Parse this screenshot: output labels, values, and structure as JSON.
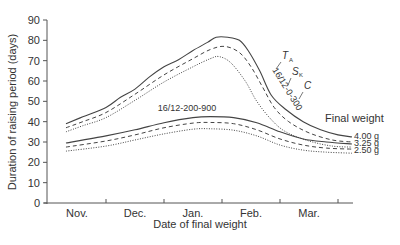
{
  "chart_data": {
    "type": "line",
    "title": "",
    "xlabel": "Date of final weight",
    "ylabel": "Duration of raising period (days)",
    "ylim": [
      0,
      90
    ],
    "yticks": [
      0,
      10,
      20,
      30,
      40,
      50,
      60,
      70,
      80,
      90
    ],
    "x_categories": [
      "Nov.",
      "Dec.",
      "Jan.",
      "Feb.",
      "Mar."
    ],
    "x_note": "x values expressed as month index (0=Nov tick, 1=Dec, 2=Jan, 3=Feb, 4=Mar)",
    "grid": false,
    "legend": {
      "title": "Final weight",
      "position": "right",
      "entries": [
        {
          "label": "4.00 g",
          "style": "solid"
        },
        {
          "label": "3.25 g",
          "style": "dashed"
        },
        {
          "label": "2.50 g",
          "style": "dotted"
        }
      ]
    },
    "annotations": [
      {
        "text": "16/12-0-300",
        "group": "upper"
      },
      {
        "text": "16/12-200-900",
        "group": "lower"
      },
      {
        "text": "T",
        "sub": "A"
      },
      {
        "text": "S",
        "sub": "K"
      },
      {
        "text": "C"
      }
    ],
    "series": [
      {
        "name": "16/12-0-300 4.00 g",
        "style": "solid",
        "x": [
          -0.69,
          -0.4,
          0,
          0.25,
          0.5,
          0.75,
          1,
          1.25,
          1.5,
          1.75,
          1.9,
          2.1,
          2.3,
          2.45,
          2.65,
          2.85,
          3.1,
          3.4,
          3.7,
          4.0,
          4.24
        ],
        "y": [
          39,
          42.4,
          47,
          52,
          56,
          62,
          67,
          70.5,
          75,
          79,
          81.5,
          81.5,
          80,
          75,
          65,
          53,
          46,
          40,
          36,
          33.5,
          32.5
        ]
      },
      {
        "name": "16/12-0-300 3.25 g",
        "style": "dashed",
        "x": [
          -0.69,
          -0.4,
          0,
          0.5,
          1,
          1.5,
          1.8,
          2.05,
          2.3,
          2.5,
          2.7,
          2.9,
          3.15,
          3.5,
          3.9,
          4.24
        ],
        "y": [
          37,
          40,
          44.5,
          53.5,
          63,
          71,
          75.5,
          77,
          74,
          67,
          57,
          47,
          40,
          34.5,
          31,
          30
        ]
      },
      {
        "name": "16/12-0-300 2.50 g",
        "style": "dotted",
        "x": [
          -0.69,
          -0.4,
          0,
          0.5,
          1,
          1.5,
          1.8,
          1.95,
          2.15,
          2.4,
          2.6,
          2.85,
          3.1,
          3.5,
          3.9,
          4.24
        ],
        "y": [
          35,
          38,
          42,
          50.5,
          59.5,
          67,
          71,
          72,
          69,
          60,
          50,
          41,
          35,
          30.5,
          28,
          27.5
        ]
      },
      {
        "name": "16/12-200-900 4.00 g",
        "style": "solid",
        "x": [
          -0.69,
          0,
          0.5,
          1,
          1.5,
          1.8,
          2.2,
          2.6,
          3,
          3.4,
          3.8,
          4.24
        ],
        "y": [
          29.5,
          33,
          36,
          39.5,
          42,
          42.5,
          42,
          39.5,
          35,
          31.5,
          30,
          29
        ]
      },
      {
        "name": "16/12-200-900 3.25 g",
        "style": "dashed",
        "x": [
          -0.69,
          0,
          0.5,
          1,
          1.5,
          1.8,
          2.2,
          2.6,
          3,
          3.4,
          3.8,
          4.24
        ],
        "y": [
          27.5,
          30.5,
          33.5,
          37,
          39.3,
          39.6,
          39,
          36,
          31.5,
          28.5,
          27,
          26.5
        ]
      },
      {
        "name": "16/12-200-900 2.50 g",
        "style": "dotted",
        "x": [
          -0.69,
          0,
          0.5,
          1,
          1.5,
          1.8,
          2.2,
          2.6,
          3,
          3.4,
          3.8,
          4.24
        ],
        "y": [
          25.5,
          28,
          31,
          34,
          36.3,
          36.5,
          35.8,
          33,
          28.5,
          26,
          25,
          24.5
        ]
      }
    ]
  },
  "labels": {
    "upper_group": "16/12-0-300",
    "lower_group": "16/12-200-900",
    "ta_main": "T",
    "ta_sub": "A",
    "sk_main": "S",
    "sk_sub": "K",
    "c": "C",
    "legend_title": "Final weight",
    "legend_400": "4.00 g",
    "legend_325": "3.25 g",
    "legend_250": "2.50 g",
    "xlabel": "Date of final weight",
    "ylabel": "Duration of raising period (days)"
  }
}
